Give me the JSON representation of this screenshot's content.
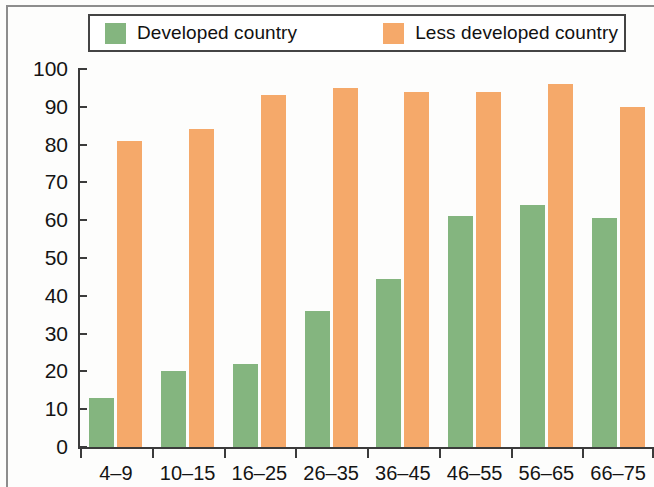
{
  "legend": {
    "items": [
      {
        "label": "Developed country",
        "color": "#84b57f",
        "key": "developed"
      },
      {
        "label": "Less developed country",
        "color": "#f5a96a",
        "key": "less_developed"
      }
    ]
  },
  "chart_data": {
    "type": "bar",
    "title": "",
    "subtitle": "",
    "xlabel": "",
    "ylabel": "",
    "categories": [
      "4–9",
      "10–15",
      "16–25",
      "26–35",
      "36–45",
      "46–55",
      "56–65",
      "66–75"
    ],
    "series": [
      {
        "name": "Developed country",
        "color": "#84b57f",
        "values": [
          13,
          20,
          22,
          36,
          44.5,
          61,
          64,
          60.5
        ]
      },
      {
        "name": "Less developed country",
        "color": "#f5a96a",
        "values": [
          81,
          84,
          93,
          95,
          94,
          94,
          96,
          90
        ]
      }
    ],
    "ylim": [
      0,
      100
    ],
    "yticks": [
      0,
      10,
      20,
      30,
      40,
      50,
      60,
      70,
      80,
      90,
      100
    ],
    "ytick_labels": [
      "0",
      "10",
      "20",
      "30",
      "40",
      "50",
      "60",
      "70",
      "80",
      "90",
      "100"
    ],
    "grid": false,
    "legend_position": "top"
  }
}
